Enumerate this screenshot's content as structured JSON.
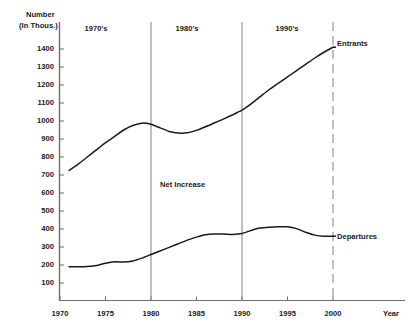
{
  "chart_data": {
    "type": "line",
    "title": "",
    "subtitle": "",
    "xlabel": "Year",
    "ylabel": "Number (In Thous.)",
    "ylabel_line1": "Number",
    "ylabel_line2": "(In Thous.)",
    "grid": false,
    "legend_position": "inline-right",
    "xlim": [
      1970,
      2000
    ],
    "ylim": [
      0,
      1450
    ],
    "y_ticks": [
      100,
      200,
      300,
      400,
      500,
      600,
      700,
      800,
      900,
      1000,
      1100,
      1200,
      1300,
      1400
    ],
    "x_ticks": [
      1970,
      1975,
      1980,
      1985,
      1990,
      1995,
      2000
    ],
    "era_dividers": [
      1980,
      1990,
      2000
    ],
    "eras": [
      {
        "label": "1970's",
        "start": 1970,
        "end": 1980
      },
      {
        "label": "1980's",
        "start": 1980,
        "end": 1990
      },
      {
        "label": "1990's",
        "start": 1990,
        "end": 2000
      }
    ],
    "annotations": [
      {
        "text": "Net Increase",
        "x": 1986,
        "y": 560
      }
    ],
    "series": [
      {
        "name": "Entrants",
        "color": "#1a1a1a",
        "x": [
          1971,
          1972,
          1973,
          1974,
          1975,
          1976,
          1977,
          1978,
          1979,
          1980,
          1981,
          1982,
          1983,
          1984,
          1985,
          1986,
          1987,
          1988,
          1989,
          1990,
          1991,
          1992,
          1993,
          1994,
          1995,
          1996,
          1997,
          1998,
          1999,
          2000
        ],
        "values": [
          725,
          760,
          800,
          840,
          880,
          915,
          950,
          975,
          988,
          982,
          962,
          942,
          933,
          935,
          948,
          968,
          990,
          1012,
          1035,
          1060,
          1095,
          1135,
          1175,
          1210,
          1245,
          1280,
          1315,
          1350,
          1382,
          1410
        ]
      },
      {
        "name": "Departures",
        "color": "#1a1a1a",
        "x": [
          1971,
          1972,
          1973,
          1974,
          1975,
          1976,
          1977,
          1978,
          1979,
          1980,
          1981,
          1982,
          1983,
          1984,
          1985,
          1986,
          1987,
          1988,
          1989,
          1990,
          1991,
          1992,
          1993,
          1994,
          1995,
          1996,
          1997,
          1998,
          1999,
          2000
        ],
        "values": [
          190,
          190,
          192,
          197,
          210,
          218,
          216,
          222,
          238,
          258,
          278,
          298,
          318,
          338,
          355,
          368,
          372,
          372,
          370,
          375,
          392,
          405,
          410,
          412,
          412,
          402,
          382,
          366,
          360,
          360
        ]
      }
    ]
  },
  "axis": {
    "y_title_line1": "Number",
    "y_title_line2": "(In Thous.)",
    "x_title": "Year",
    "y_tick_labels": [
      "1400",
      "1300",
      "1200",
      "1100",
      "1000",
      "900",
      "800",
      "700",
      "600",
      "500",
      "400",
      "300",
      "200",
      "100"
    ],
    "x_tick_labels": [
      "1970",
      "1975",
      "1980",
      "1985",
      "1990",
      "1995",
      "2000"
    ]
  },
  "eras": {
    "labels": [
      "1970's",
      "1980's",
      "1990's"
    ]
  },
  "series_labels": {
    "entrants": "Entrants",
    "departures": "Departures"
  },
  "annotations": {
    "net_increase": "Net Increase"
  },
  "colors": {
    "line": "#1a1a1a",
    "axis": "#6f6f6f",
    "divider": "#8a8a8a",
    "background": "#ffffff"
  }
}
